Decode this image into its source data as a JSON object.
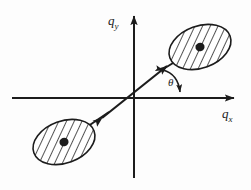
{
  "figure": {
    "background_color": "#fdfdfd",
    "ink_color": "#1c1c1c",
    "width": 251,
    "height": 190
  },
  "axes": {
    "x_axis": {
      "label_q": "q",
      "label_sub": "x",
      "arrow_direction": "right",
      "y_position": 98,
      "start_x": 12,
      "end_x": 240
    },
    "y_axis": {
      "label_q": "q",
      "label_sub": "y",
      "arrow_direction": "up",
      "x_position": 134,
      "start_y": 178,
      "end_y": 10
    }
  },
  "angle": {
    "symbol": "θ",
    "between": "diagonal-axis and positive-qx-axis",
    "arc_style": "double-headed-curved-arrow"
  },
  "diagonal": {
    "style": "double-headed-straight-arrow",
    "angle_degrees": 30,
    "passes_through": "origin",
    "tip_upper_right": [
      172,
      62
    ],
    "tip_lower_left": [
      96,
      122
    ]
  },
  "lobes": [
    {
      "name": "upper-right-lobe",
      "center": [
        200,
        47
      ],
      "rx": 32,
      "ry": 21,
      "rotation_degrees": -20,
      "fill": "hatched",
      "hatch_angle_degrees": 45,
      "center_dot": true
    },
    {
      "name": "lower-left-lobe",
      "center": [
        64,
        142
      ],
      "rx": 32,
      "ry": 21,
      "rotation_degrees": -20,
      "fill": "hatched",
      "hatch_angle_degrees": 45,
      "center_dot": true
    }
  ]
}
